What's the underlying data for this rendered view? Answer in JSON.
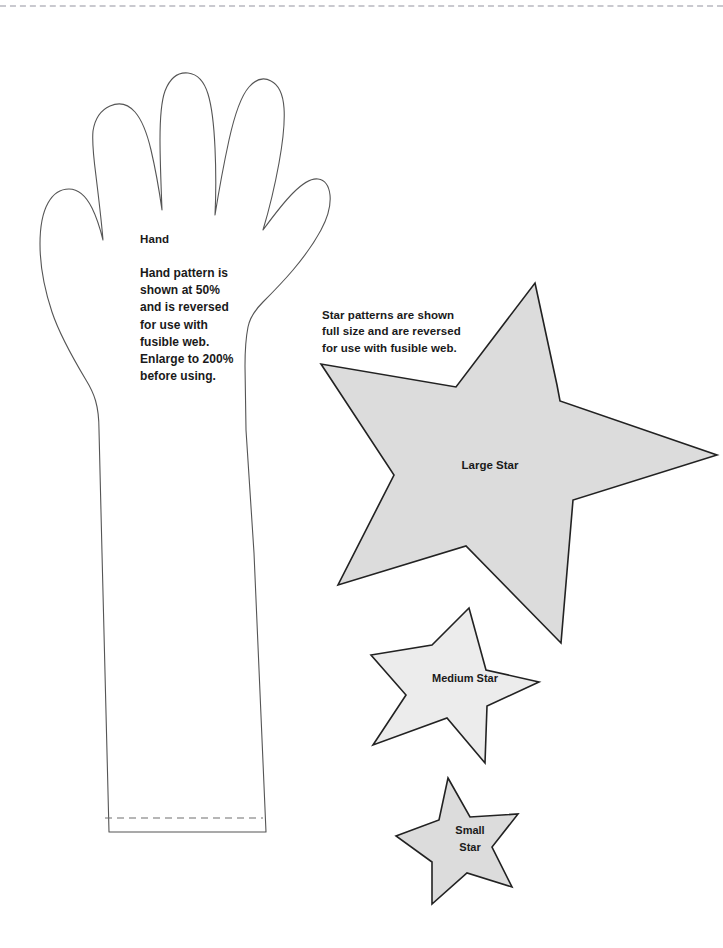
{
  "page": {
    "width": 723,
    "height": 948,
    "background": "#ffffff"
  },
  "decorations": {
    "top_dashed_rule": {
      "name": "top-dashed-rule",
      "color": "#c9c9cf",
      "style": "dashed"
    },
    "wrist_fold_line": {
      "name": "arm-fold-dashed-line",
      "color": "#6f6f6f",
      "style": "dashed"
    }
  },
  "hand": {
    "title": "Hand",
    "note": "Hand pattern is\nshown at 50%\nand is reversed\nfor use with\nfusible web.\nEnlarge to 200%\nbefore using.",
    "outline_color": "#555555",
    "fill_color": "#ffffff"
  },
  "stars": {
    "note": "Star patterns are shown\nfull size and are reversed\nfor use with fusible web.",
    "fill_color": "#dcdcdc",
    "outline_color": "#222222",
    "items": [
      {
        "label": "Large Star",
        "size": "large"
      },
      {
        "label": "Medium Star",
        "size": "medium"
      },
      {
        "label": "Small\nStar",
        "size": "small"
      }
    ]
  }
}
